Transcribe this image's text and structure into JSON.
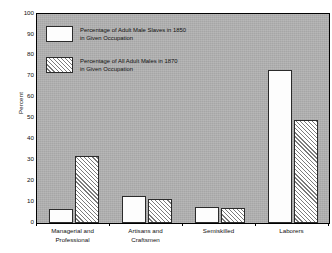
{
  "chart_data": {
    "type": "bar",
    "title": "",
    "xlabel": "",
    "ylabel": "Percent",
    "ylim": [
      0,
      100
    ],
    "ytick_labels": [
      "0",
      "10",
      "20",
      "30",
      "40",
      "50",
      "60",
      "70",
      "80",
      "90",
      "100"
    ],
    "ytick_values": [
      0,
      10,
      20,
      30,
      40,
      50,
      60,
      70,
      80,
      90,
      100
    ],
    "grid": false,
    "legend_position": "upper-left",
    "categories": [
      "Managerial and Professional",
      "Artisans and Craftsmen",
      "Semiskilled",
      "Laborers"
    ],
    "category_lines": [
      [
        "Managerial and",
        "Professional"
      ],
      [
        "Artisans and",
        "Craftsmen"
      ],
      [
        "Semiskilled",
        ""
      ],
      [
        "Laborers",
        ""
      ]
    ],
    "series": [
      {
        "name": "Percentage of Adult Male Slaves in 1850 in Given Occupation",
        "style": "solid",
        "values": [
          6.5,
          13.0,
          7.5,
          73.0
        ]
      },
      {
        "name": "Percentage of All Adult Males in 1870 in Given Occupation",
        "style": "hatched",
        "values": [
          32.0,
          11.5,
          7.0,
          49.5
        ]
      }
    ]
  },
  "legend": {
    "entries": [
      {
        "line1": "Percentage of Adult Male Slaves in 1850",
        "line2": "in Given Occupation",
        "swatch": "solid-white-swatch"
      },
      {
        "line1": "Percentage of All Adult Males in 1870",
        "line2": "in Given Occupation",
        "swatch": "diagonal-hatch-swatch"
      }
    ]
  },
  "colors": {
    "plot_background": "#b2b2b2",
    "page_background": "#ffffff",
    "axis": "#000000",
    "bar_solid": "#fdfdfd",
    "bar_hatch_line": "#7b7b7b",
    "text": "#111111"
  }
}
